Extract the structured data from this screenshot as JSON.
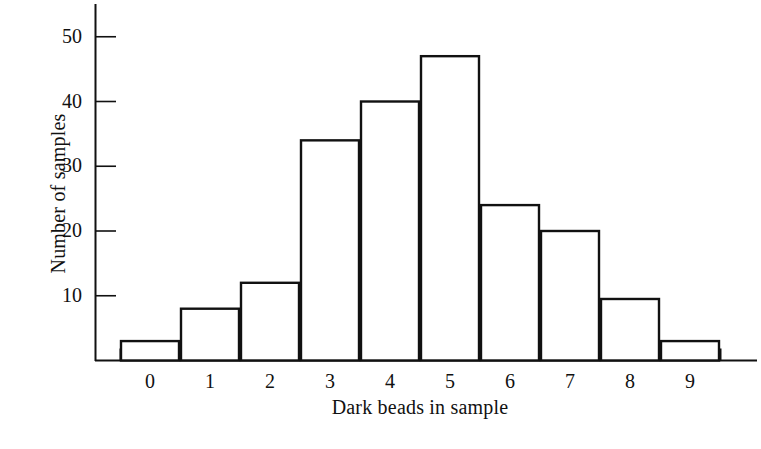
{
  "chart_data": {
    "type": "bar",
    "title": "",
    "subtitle": "",
    "xlabel": "Dark beads in sample",
    "ylabel": "Number of samples",
    "categories": [
      "0",
      "1",
      "2",
      "3",
      "4",
      "5",
      "6",
      "7",
      "8",
      "9"
    ],
    "values": [
      3,
      8,
      12,
      34,
      40,
      47,
      24,
      20,
      9.5,
      3
    ],
    "series": [
      {
        "name": "Number of samples",
        "values": [
          3,
          8,
          12,
          34,
          40,
          47,
          24,
          20,
          9.5,
          3
        ]
      }
    ],
    "xlim": [
      -0.5,
      9.5
    ],
    "ylim": [
      0,
      54
    ],
    "y_ticks": [
      10,
      20,
      30,
      40,
      50
    ],
    "y_tick_labels": [
      "10",
      "20",
      "30",
      "40",
      "50"
    ],
    "x_ticks": [
      0,
      1,
      2,
      3,
      4,
      5,
      6,
      7,
      8,
      9
    ],
    "x_tick_labels": [
      "0",
      "1",
      "2",
      "3",
      "4",
      "5",
      "6",
      "7",
      "8",
      "9"
    ],
    "grid": false,
    "legend": null,
    "legend_position": "none",
    "bar_fill": "#ffffff",
    "bar_edge": "#111111",
    "axis_color": "#111111",
    "background": "#ffffff",
    "annotations": []
  },
  "figure": {
    "name": "histogram-dark-beads",
    "width": 761,
    "height": 449
  }
}
